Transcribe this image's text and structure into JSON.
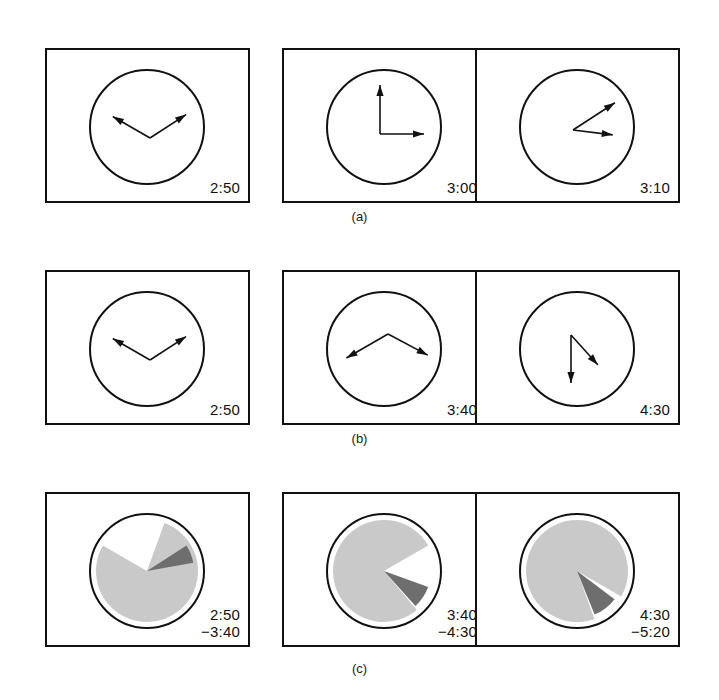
{
  "figure": {
    "background_color": "#ffffff",
    "stroke_color": "#111111",
    "light_gray": "#c9c9c9",
    "dark_gray": "#6e6e6e"
  },
  "rows": [
    {
      "caption": "(a)",
      "panels": [
        {
          "label_line1": "2:50",
          "label_line2": "",
          "clock": {
            "kind": "hands",
            "vertex_x": 103,
            "vertex_y": 88,
            "hands": [
              {
                "name": "minute-hand",
                "angle_deg": 300,
                "length": 43
              },
              {
                "name": "hour-hand",
                "angle_deg": 57,
                "length": 43
              }
            ]
          }
        },
        {
          "label_line1": "3:00",
          "label_line2": "",
          "clock": {
            "kind": "hands",
            "vertex_x": 96,
            "vertex_y": 84,
            "hands": [
              {
                "name": "minute-hand",
                "angle_deg": 0,
                "length": 49
              },
              {
                "name": "hour-hand",
                "angle_deg": 90,
                "length": 44
              }
            ]
          }
        },
        {
          "label_line1": "3:10",
          "label_line2": "",
          "clock": {
            "kind": "hands",
            "vertex_x": 96,
            "vertex_y": 80,
            "hands": [
              {
                "name": "minute-hand",
                "angle_deg": 57,
                "length": 50
              },
              {
                "name": "hour-hand",
                "angle_deg": 97,
                "length": 40
              }
            ]
          }
        }
      ]
    },
    {
      "caption": "(b)",
      "panels": [
        {
          "label_line1": "2:50",
          "label_line2": "",
          "clock": {
            "kind": "hands",
            "vertex_x": 103,
            "vertex_y": 88,
            "hands": [
              {
                "name": "minute-hand",
                "angle_deg": 300,
                "length": 43
              },
              {
                "name": "hour-hand",
                "angle_deg": 57,
                "length": 43
              }
            ]
          }
        },
        {
          "label_line1": "3:40",
          "label_line2": "",
          "clock": {
            "kind": "hands",
            "vertex_x": 104,
            "vertex_y": 62,
            "hands": [
              {
                "name": "minute-hand",
                "angle_deg": 240,
                "length": 48
              },
              {
                "name": "hour-hand",
                "angle_deg": 118,
                "length": 45
              }
            ]
          }
        },
        {
          "label_line1": "4:30",
          "label_line2": "",
          "clock": {
            "kind": "hands",
            "vertex_x": 94,
            "vertex_y": 63,
            "hands": [
              {
                "name": "minute-hand",
                "angle_deg": 180,
                "length": 48
              },
              {
                "name": "hour-hand",
                "angle_deg": 138,
                "length": 40
              }
            ]
          }
        }
      ]
    },
    {
      "caption": "(c)",
      "panels": [
        {
          "label_line1": "2:50",
          "label_line2": "−3:40",
          "clock": {
            "kind": "sectors",
            "light_start_deg": 20,
            "light_end_deg": 300,
            "dark_start_deg": 57,
            "dark_end_deg": 80
          }
        },
        {
          "label_line1": "3:40",
          "label_line2": "−4:30",
          "clock": {
            "kind": "sectors",
            "light_start_deg": 140,
            "light_end_deg": 60,
            "dark_start_deg": 110,
            "dark_end_deg": 138
          }
        },
        {
          "label_line1": "4:30",
          "label_line2": "−5:20",
          "clock": {
            "kind": "sectors",
            "light_start_deg": 160,
            "light_end_deg": 120,
            "dark_start_deg": 127,
            "dark_end_deg": 158
          }
        }
      ]
    }
  ]
}
